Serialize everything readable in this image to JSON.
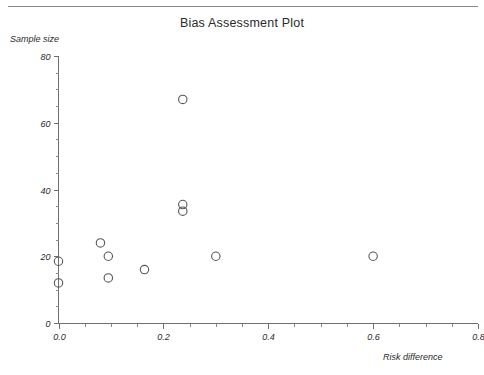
{
  "chart_data": {
    "type": "scatter",
    "title": "Bias Assessment Plot",
    "xlabel": "Risk difference",
    "ylabel": "Sample size",
    "xlim": [
      0.0,
      0.8
    ],
    "ylim": [
      0,
      80
    ],
    "grid": false,
    "legend": null,
    "x_ticks": [
      {
        "value": 0.0,
        "label": "0.0",
        "major": true
      },
      {
        "value": 0.05,
        "label": "",
        "major": false
      },
      {
        "value": 0.1,
        "label": "",
        "major": false
      },
      {
        "value": 0.15,
        "label": "",
        "major": false
      },
      {
        "value": 0.2,
        "label": "0.2",
        "major": true
      },
      {
        "value": 0.25,
        "label": "",
        "major": false
      },
      {
        "value": 0.3,
        "label": "",
        "major": false
      },
      {
        "value": 0.35,
        "label": "",
        "major": false
      },
      {
        "value": 0.4,
        "label": "0.4",
        "major": true
      },
      {
        "value": 0.45,
        "label": "",
        "major": false
      },
      {
        "value": 0.5,
        "label": "",
        "major": false
      },
      {
        "value": 0.55,
        "label": "",
        "major": false
      },
      {
        "value": 0.6,
        "label": "0.6",
        "major": true
      },
      {
        "value": 0.65,
        "label": "",
        "major": false
      },
      {
        "value": 0.7,
        "label": "",
        "major": false
      },
      {
        "value": 0.75,
        "label": "",
        "major": false
      },
      {
        "value": 0.8,
        "label": "0.8",
        "major": true
      }
    ],
    "y_ticks": [
      {
        "value": 0,
        "label": "0",
        "major": true
      },
      {
        "value": 5,
        "label": "",
        "major": false
      },
      {
        "value": 10,
        "label": "",
        "major": false
      },
      {
        "value": 15,
        "label": "",
        "major": false
      },
      {
        "value": 20,
        "label": "20",
        "major": true
      },
      {
        "value": 25,
        "label": "",
        "major": false
      },
      {
        "value": 30,
        "label": "",
        "major": false
      },
      {
        "value": 35,
        "label": "",
        "major": false
      },
      {
        "value": 40,
        "label": "40",
        "major": true
      },
      {
        "value": 45,
        "label": "",
        "major": false
      },
      {
        "value": 50,
        "label": "",
        "major": false
      },
      {
        "value": 55,
        "label": "",
        "major": false
      },
      {
        "value": 60,
        "label": "60",
        "major": true
      },
      {
        "value": 65,
        "label": "",
        "major": false
      },
      {
        "value": 70,
        "label": "",
        "major": false
      },
      {
        "value": 75,
        "label": "",
        "major": false
      },
      {
        "value": 80,
        "label": "80",
        "major": true
      }
    ],
    "marker": {
      "shape": "circle",
      "radius": 4.2,
      "fill": "none",
      "stroke": "#555555"
    },
    "points": [
      {
        "x": 0.0,
        "y": 18.5
      },
      {
        "x": 0.0,
        "y": 12.0
      },
      {
        "x": 0.08,
        "y": 24.0
      },
      {
        "x": 0.095,
        "y": 20.0
      },
      {
        "x": 0.095,
        "y": 13.5
      },
      {
        "x": 0.164,
        "y": 16.0
      },
      {
        "x": 0.237,
        "y": 67.0
      },
      {
        "x": 0.237,
        "y": 35.5
      },
      {
        "x": 0.237,
        "y": 33.5
      },
      {
        "x": 0.3,
        "y": 20.0
      },
      {
        "x": 0.6,
        "y": 20.0
      }
    ]
  },
  "colors": {
    "axis": "#6f6f6f",
    "tick_minor": "#8a8a8a",
    "text": "#2b2b2b",
    "marker_stroke": "#555555",
    "background": "#ffffff",
    "rule": "#8a8a8a"
  }
}
